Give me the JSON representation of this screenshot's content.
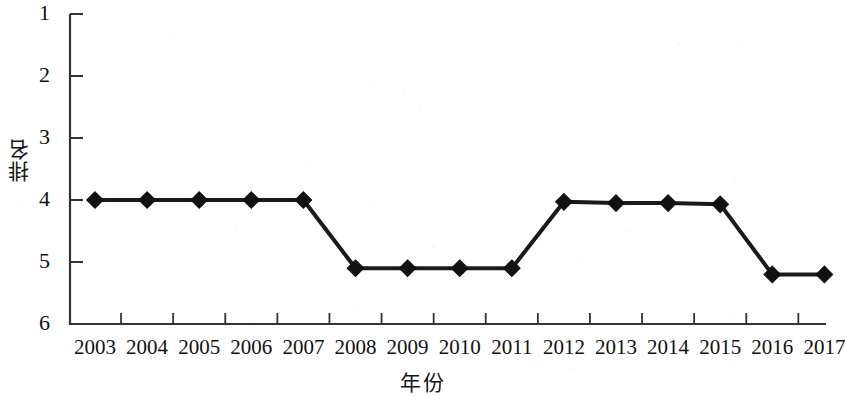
{
  "chart_data": {
    "type": "line",
    "title": "",
    "subtitle": "",
    "xlabel": "年份",
    "ylabel": "排名",
    "categories": [
      "2003",
      "2004",
      "2005",
      "2006",
      "2007",
      "2008",
      "2009",
      "2010",
      "2011",
      "2012",
      "2013",
      "2014",
      "2015",
      "2016",
      "2017"
    ],
    "values": [
      4.0,
      4.0,
      4.0,
      4.0,
      4.0,
      5.1,
      5.1,
      5.1,
      5.1,
      4.03,
      4.05,
      4.05,
      4.07,
      5.2,
      5.2
    ],
    "series": [
      {
        "name": "排名",
        "values": [
          4.0,
          4.0,
          4.0,
          4.0,
          4.0,
          5.1,
          5.1,
          5.1,
          5.1,
          4.03,
          4.05,
          4.05,
          4.07,
          5.2,
          5.2
        ]
      }
    ],
    "ylim": [
      1,
      6
    ],
    "y_inverted": true,
    "y_ticks": [
      "1",
      "2",
      "3",
      "4",
      "5",
      "6"
    ],
    "y_tick_values": [
      1,
      2,
      3,
      4,
      5,
      6
    ],
    "x_ticks": [
      "2003",
      "2004",
      "2005",
      "2006",
      "2007",
      "2008",
      "2009",
      "2010",
      "2011",
      "2012",
      "2013",
      "2014",
      "2015",
      "2016",
      "2017"
    ],
    "grid": false,
    "legend": false,
    "legend_position": "none",
    "marker": "diamond",
    "line_color": "#1a1a1a",
    "marker_color": "#111111",
    "axis_color": "#333333",
    "background_color": "#ffffff",
    "annotations": []
  },
  "axis": {
    "y_label": "排名",
    "x_label": "年份"
  }
}
